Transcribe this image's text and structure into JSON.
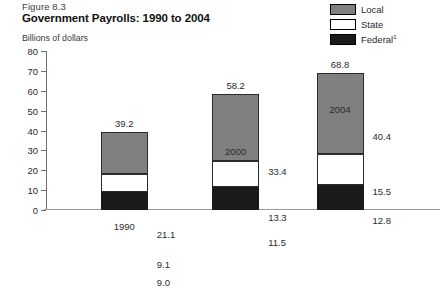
{
  "figure": {
    "number": "Figure 8.3",
    "title": "Government Payrolls: 1990 to 2004",
    "axis_note": "Billions of dollars"
  },
  "legend": {
    "position": "top-right",
    "items": [
      {
        "label": "Local",
        "color": "#808080",
        "name": "local"
      },
      {
        "label": "State",
        "color": "#ffffff",
        "name": "state"
      },
      {
        "label": "Federal",
        "color": "#1a1a1a",
        "name": "federal",
        "footnote": "1"
      }
    ]
  },
  "chart_data": {
    "type": "bar",
    "stacked": true,
    "title": "Government Payrolls: 1990 to 2004",
    "subtitle": "Figure 8.3",
    "xlabel": "",
    "ylabel": "Billions of dollars",
    "categories": [
      "1990",
      "2000",
      "2004"
    ],
    "ylim": [
      0,
      80
    ],
    "yticks": [
      0,
      10,
      20,
      30,
      40,
      50,
      60,
      70,
      80
    ],
    "ytick_labels": [
      "0",
      "10",
      "20",
      "30",
      "40",
      "50",
      "60",
      "70",
      "80"
    ],
    "grid": false,
    "series": [
      {
        "name": "Federal",
        "color": "#1a1a1a",
        "values": [
          9.0,
          11.5,
          12.8
        ],
        "labels": [
          "9.0",
          "11.5",
          "12.8"
        ]
      },
      {
        "name": "State",
        "color": "#ffffff",
        "values": [
          9.1,
          13.3,
          15.5
        ],
        "labels": [
          "9.1",
          "13.3",
          "15.5"
        ]
      },
      {
        "name": "Local",
        "color": "#808080",
        "values": [
          21.1,
          33.4,
          40.4
        ],
        "labels": [
          "21.1",
          "33.4",
          "40.4"
        ]
      }
    ],
    "totals": [
      39.2,
      58.2,
      68.8
    ],
    "total_labels": [
      "39.2",
      "58.2",
      "68.8"
    ]
  }
}
